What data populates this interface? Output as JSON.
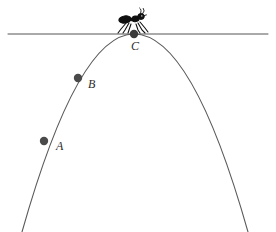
{
  "figure": {
    "canvas": {
      "width": 276,
      "height": 232,
      "background": "#ffffff"
    },
    "tangent_line": {
      "name": "horizontal-tangent-line",
      "y": 34,
      "x_start": 8,
      "x_end": 268,
      "color": "#555555",
      "stroke_width": 1
    },
    "parabola": {
      "name": "parabola-curve",
      "color": "#5a5a5a",
      "stroke_width": 1.1,
      "vertex": {
        "x": 134,
        "y": 34
      },
      "left_end": {
        "x": 22,
        "y": 232
      },
      "right_end": {
        "x": 248,
        "y": 232
      },
      "path": "M 22 232 Q 78 34 134 34 Q 192 34 248 232"
    },
    "points": [
      {
        "id": "A",
        "label": "A",
        "x": 44,
        "y": 141,
        "radius": 4.2,
        "color": "#4a4a4a",
        "label_x": 56,
        "label_y": 140
      },
      {
        "id": "B",
        "label": "B",
        "x": 78,
        "y": 78,
        "radius": 4.2,
        "color": "#4a4a4a",
        "label_x": 88,
        "label_y": 78
      },
      {
        "id": "C",
        "label": "C",
        "x": 134,
        "y": 34,
        "radius": 4.2,
        "color": "#3a3a3a",
        "label_x": 131,
        "label_y": 40
      }
    ],
    "ant": {
      "name": "ant-figure",
      "color": "#101010",
      "center_x": 134,
      "base_y": 33,
      "facing": "right"
    }
  }
}
